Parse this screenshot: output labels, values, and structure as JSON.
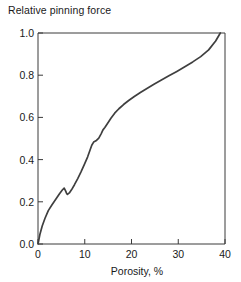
{
  "figure": {
    "width": 241,
    "height": 282,
    "background": "#ffffff",
    "line_color": "#3f3f3f",
    "axis_color": "#3a3a3a",
    "text_color": "#1a1a1a"
  },
  "chart_data": {
    "type": "line",
    "title": "Relative pinning force",
    "xlabel": "Porosity, %",
    "ylabel": "",
    "xlim": [
      0,
      40
    ],
    "ylim": [
      0,
      1.0
    ],
    "xticks": [
      0,
      10,
      20,
      30,
      40
    ],
    "xtick_labels": [
      "0",
      "10",
      "20",
      "30",
      "40"
    ],
    "yticks": [
      0.0,
      0.2,
      0.4,
      0.6,
      0.8,
      1.0
    ],
    "ytick_labels": [
      "0.0",
      "0.2",
      "0.4",
      "0.6",
      "0.8",
      "1.0"
    ],
    "grid": false,
    "legend": null,
    "series": [
      {
        "name": "Relative pinning force",
        "x": [
          0.0,
          0.4,
          0.9,
          1.5,
          2.2,
          3.0,
          3.8,
          4.6,
          5.2,
          5.6,
          5.9,
          6.1,
          6.3,
          6.7,
          7.2,
          7.8,
          8.5,
          9.2,
          9.9,
          10.6,
          11.1,
          11.5,
          11.9,
          12.4,
          13.0,
          13.5,
          13.9,
          14.3,
          14.9,
          15.6,
          16.4,
          17.3,
          18.3,
          19.4,
          20.6,
          21.9,
          23.3,
          24.8,
          26.4,
          28.0,
          29.7,
          31.4,
          33.1,
          34.8,
          36.5,
          38.0,
          39.0
        ],
        "y": [
          0.0,
          0.045,
          0.085,
          0.122,
          0.158,
          0.186,
          0.212,
          0.238,
          0.256,
          0.265,
          0.252,
          0.241,
          0.235,
          0.242,
          0.258,
          0.281,
          0.31,
          0.342,
          0.376,
          0.412,
          0.443,
          0.468,
          0.483,
          0.489,
          0.502,
          0.522,
          0.541,
          0.552,
          0.572,
          0.596,
          0.62,
          0.641,
          0.661,
          0.68,
          0.699,
          0.718,
          0.737,
          0.757,
          0.777,
          0.797,
          0.818,
          0.84,
          0.863,
          0.888,
          0.92,
          0.962,
          1.0
        ]
      }
    ]
  }
}
